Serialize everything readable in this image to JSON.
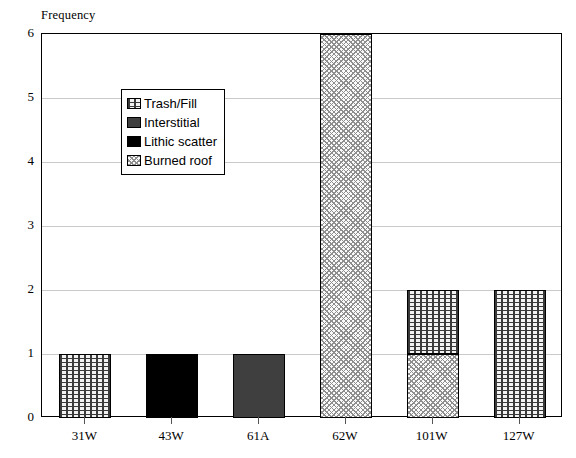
{
  "chart_data": {
    "type": "bar",
    "subtype": "stacked-bar",
    "title": "",
    "xlabel": "",
    "ylabel": "Frequency",
    "ylim": [
      0,
      6
    ],
    "ytick_labels": [
      "0",
      "1",
      "2",
      "3",
      "4",
      "5",
      "6"
    ],
    "ytick_values": [
      0,
      1,
      2,
      3,
      4,
      5,
      6
    ],
    "grid": "horizontal",
    "legend_position": "upper-left-inside",
    "categories": [
      "31W",
      "43W",
      "61A",
      "62W",
      "101W",
      "127W"
    ],
    "series": [
      {
        "name": "Trash/Fill",
        "pattern": "dotted",
        "color": "#f2f2f2",
        "values": [
          1,
          0,
          0,
          0,
          1,
          2
        ]
      },
      {
        "name": "Interstitial",
        "pattern": "solid-gray",
        "color": "#3f3f3f",
        "values": [
          0,
          0,
          1,
          0,
          0,
          0
        ]
      },
      {
        "name": "Lithic scatter",
        "pattern": "solid-black",
        "color": "#000000",
        "values": [
          0,
          1,
          0,
          0,
          0,
          0
        ]
      },
      {
        "name": "Burned roof",
        "pattern": "crosshatch",
        "color": "#fafafa",
        "values": [
          0,
          0,
          0,
          6,
          1,
          0
        ]
      }
    ],
    "totals": [
      1,
      1,
      1,
      6,
      2,
      2
    ],
    "stack_order_bottom_to_top": [
      "Burned roof",
      "Lithic scatter",
      "Interstitial",
      "Trash/Fill"
    ]
  },
  "axis": {
    "y_title": "Frequency"
  },
  "legend": {
    "items": [
      {
        "label": "Trash/Fill"
      },
      {
        "label": "Interstitial"
      },
      {
        "label": "Lithic scatter"
      },
      {
        "label": "Burned roof"
      }
    ]
  }
}
